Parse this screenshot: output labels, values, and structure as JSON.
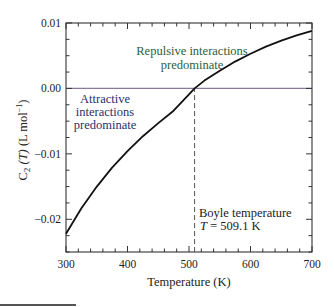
{
  "chart_data": {
    "type": "line",
    "title": "",
    "xlabel": "Temperature (K)",
    "ylabel": "C2 (T) (L mol⁻¹)",
    "ylabel_parts": {
      "symbol": "C",
      "sub": "2",
      "arg": " (T) ",
      "units": "(L mol",
      "sup": "−1",
      "close": ")"
    },
    "xlim": [
      300,
      700
    ],
    "ylim": [
      -0.025,
      0.01
    ],
    "x_ticks": [
      300,
      400,
      500,
      600,
      700
    ],
    "x_tick_labels": [
      "300",
      "400",
      "500",
      "600",
      "700"
    ],
    "y_ticks": [
      0.01,
      0.0,
      -0.01,
      -0.02
    ],
    "y_tick_labels": [
      "0.01",
      "0.00",
      "−0.01",
      "−0.02"
    ],
    "grid": false,
    "legend": null,
    "series": [
      {
        "name": "C2(T)",
        "color": "#111111",
        "x": [
          300,
          325,
          350,
          375,
          400,
          425,
          450,
          475,
          500,
          509.1,
          525,
          550,
          575,
          600,
          625,
          650,
          675,
          700
        ],
        "y": [
          -0.0222,
          -0.0183,
          -0.015,
          -0.0121,
          -0.0096,
          -0.0073,
          -0.0053,
          -0.0034,
          -0.0009,
          0.0,
          0.0012,
          0.0027,
          0.0041,
          0.0053,
          0.0064,
          0.0073,
          0.0081,
          0.0088
        ]
      }
    ],
    "reference_lines": [
      {
        "type": "horizontal",
        "y": 0.0,
        "color": "#8a7a9a",
        "style": "solid"
      },
      {
        "type": "vertical",
        "x": 509.1,
        "y_from": -0.025,
        "y_to": 0.0,
        "color": "#555555",
        "style": "dashed"
      }
    ],
    "annotations": [
      {
        "text_lines": [
          "Repulsive interactions",
          "predominate"
        ],
        "x": 560,
        "y": 0.0045,
        "color": "#2e5e3a"
      },
      {
        "text_lines": [
          "Attractive",
          "interactions",
          "predominate"
        ],
        "x": 350,
        "y": -0.004,
        "color": "#2a2f6a"
      },
      {
        "text_lines": [
          "Boyle temperature",
          "T = 509.1 K"
        ],
        "x": 515,
        "y": -0.0195,
        "color": "#222222"
      }
    ]
  },
  "labels": {
    "repulsive_1": "Repulsive interactions",
    "repulsive_2": "predominate",
    "attractive_1": "Attractive",
    "attractive_2": "interactions",
    "attractive_3": "predominate",
    "boyle_1": "Boyle temperature",
    "boyle_2_var": "T",
    "boyle_2_rest": " = 509.1 K"
  }
}
